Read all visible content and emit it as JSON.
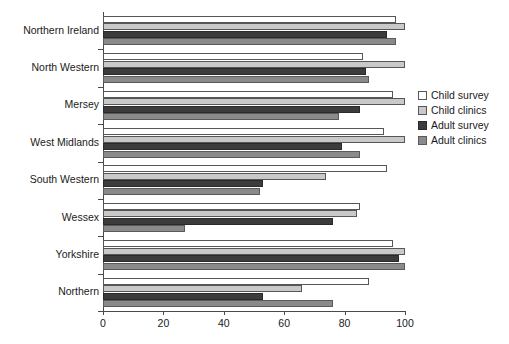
{
  "chart_data": {
    "type": "bar",
    "orientation": "horizontal",
    "title": "",
    "xlabel": "",
    "ylabel": "",
    "xlim": [
      0,
      100
    ],
    "xticks": [
      0,
      20,
      40,
      60,
      80,
      100
    ],
    "xtick_labels": [
      "0",
      "20",
      "40",
      "60",
      "80",
      "100"
    ],
    "grid": false,
    "legend_position": "right",
    "categories": [
      "Northern Ireland",
      "North Western",
      "Mersey",
      "West Midlands",
      "South Western",
      "Wessex",
      "Yorkshire",
      "Northern"
    ],
    "series": [
      {
        "name": "Child survey",
        "color": "#ffffff",
        "values": [
          97,
          86,
          96,
          93,
          94,
          85,
          96,
          88
        ]
      },
      {
        "name": "Child clinics",
        "color": "#c9c9c9",
        "values": [
          100,
          100,
          100,
          100,
          74,
          84,
          100,
          66
        ]
      },
      {
        "name": "Adult survey",
        "color": "#3c3c3c",
        "values": [
          94,
          87,
          85,
          79,
          53,
          76,
          98,
          53
        ]
      },
      {
        "name": "Adult clinics",
        "color": "#8a8a8a",
        "values": [
          97,
          88,
          78,
          85,
          52,
          27,
          100,
          76
        ]
      }
    ]
  },
  "legend": {
    "items": [
      {
        "label": "Child survey",
        "key": "child-survey"
      },
      {
        "label": "Child clinics",
        "key": "child-clinics"
      },
      {
        "label": "Adult survey",
        "key": "adult-survey"
      },
      {
        "label": "Adult clinics",
        "key": "adult-clinics"
      }
    ]
  }
}
